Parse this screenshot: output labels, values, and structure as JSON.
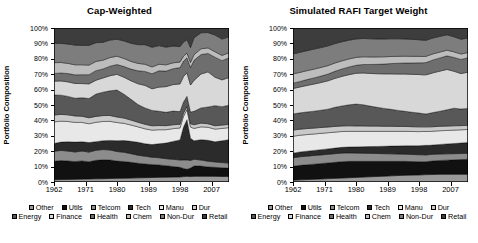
{
  "figure": {
    "ylabel": "Portfolio Composition",
    "y_ticks": [
      "0%",
      "10%",
      "20%",
      "30%",
      "40%",
      "50%",
      "60%",
      "70%",
      "80%",
      "90%",
      "100%"
    ],
    "x_ticks": [
      "1962",
      "1971",
      "1980",
      "1989",
      "1998",
      "2007"
    ]
  },
  "legend": {
    "rows": [
      [
        {
          "label": "Other",
          "color": "#9a9a9a"
        },
        {
          "label": "Utils",
          "color": "#111111"
        },
        {
          "label": "Telcom",
          "color": "#8c8c8c"
        },
        {
          "label": "Tech",
          "color": "#2b2b2b"
        },
        {
          "label": "Manu",
          "color": "#e8e8e8"
        },
        {
          "label": "Dur",
          "color": "#c9c9c9"
        }
      ],
      [
        {
          "label": "Energy",
          "color": "#585858"
        },
        {
          "label": "Finance",
          "color": "#d8d8d8"
        },
        {
          "label": "Health",
          "color": "#6e6e6e"
        },
        {
          "label": "Chem",
          "color": "#bdbdbd"
        },
        {
          "label": "Non-Dur",
          "color": "#7d7d7d"
        },
        {
          "label": "Retail",
          "color": "#3d3d3d"
        }
      ]
    ]
  },
  "chart_data": [
    {
      "type": "area",
      "title": "Cap-Weighted",
      "xlabel": "",
      "ylabel": "Portfolio Composition",
      "stacked": true,
      "normalized_percent": true,
      "ylim": [
        0,
        100
      ],
      "xlim": [
        1962,
        2012
      ],
      "grid": false,
      "legend_position": "bottom",
      "x": [
        1962,
        1964,
        1966,
        1968,
        1970,
        1972,
        1974,
        1976,
        1978,
        1980,
        1982,
        1984,
        1986,
        1988,
        1990,
        1992,
        1994,
        1996,
        1998,
        1999,
        2000,
        2001,
        2002,
        2004,
        2006,
        2008,
        2010,
        2012
      ],
      "series": [
        {
          "name": "Other",
          "color": "#9a9a9a",
          "values": [
            1.5,
            1.6,
            1.7,
            1.8,
            1.9,
            2.0,
            2.1,
            2.2,
            2.3,
            2.4,
            2.5,
            2.6,
            2.7,
            2.8,
            2.9,
            3.0,
            3.1,
            3.2,
            3.3,
            3.3,
            3.4,
            3.4,
            3.4,
            3.4,
            3.4,
            3.4,
            3.3,
            3.3
          ]
        },
        {
          "name": "Utils",
          "color": "#111111",
          "values": [
            12.0,
            12.3,
            12.0,
            11.5,
            11.8,
            11.2,
            12.0,
            12.5,
            12.0,
            11.2,
            10.8,
            10.2,
            9.5,
            8.8,
            8.4,
            8.0,
            7.4,
            6.8,
            6.2,
            5.0,
            4.2,
            5.4,
            6.2,
            6.0,
            5.6,
            5.4,
            5.2,
            5.0
          ]
        },
        {
          "name": "Telcom",
          "color": "#8c8c8c",
          "values": [
            6.5,
            6.6,
            6.4,
            6.2,
            6.4,
            6.2,
            6.5,
            6.8,
            6.5,
            6.2,
            6.0,
            5.6,
            5.2,
            5.0,
            4.8,
            4.6,
            4.5,
            4.6,
            4.8,
            5.2,
            5.6,
            4.8,
            4.0,
            3.6,
            3.4,
            3.2,
            3.1,
            3.0
          ]
        },
        {
          "name": "Tech",
          "color": "#2b2b2b",
          "values": [
            5.0,
            5.4,
            6.0,
            6.4,
            6.0,
            6.2,
            5.6,
            5.8,
            6.2,
            7.0,
            7.6,
            8.0,
            8.4,
            8.0,
            8.2,
            9.0,
            10.0,
            11.5,
            13.0,
            20.0,
            24.0,
            14.0,
            11.0,
            12.0,
            12.5,
            12.0,
            13.0,
            14.0
          ]
        },
        {
          "name": "Manu",
          "color": "#e8e8e8",
          "values": [
            14.0,
            13.6,
            13.2,
            12.8,
            12.6,
            12.2,
            12.6,
            12.8,
            12.4,
            11.8,
            11.2,
            10.6,
            10.0,
            9.6,
            9.4,
            9.0,
            8.6,
            8.2,
            7.8,
            6.6,
            6.0,
            7.0,
            7.4,
            7.6,
            7.8,
            7.6,
            7.4,
            7.2
          ]
        },
        {
          "name": "Dur",
          "color": "#c9c9c9",
          "values": [
            4.5,
            4.4,
            4.3,
            4.2,
            4.0,
            3.9,
            3.8,
            3.9,
            3.8,
            3.6,
            3.4,
            3.2,
            3.0,
            2.9,
            2.8,
            2.7,
            2.6,
            2.5,
            2.4,
            2.0,
            1.8,
            2.1,
            2.2,
            2.2,
            2.1,
            2.0,
            2.0,
            1.9
          ]
        },
        {
          "name": "Energy",
          "color": "#585858",
          "values": [
            13.0,
            12.5,
            12.0,
            11.5,
            12.0,
            12.5,
            14.5,
            15.5,
            16.0,
            17.5,
            15.5,
            13.5,
            11.5,
            10.5,
            10.0,
            9.2,
            8.6,
            8.8,
            8.2,
            6.8,
            6.2,
            7.4,
            8.0,
            9.0,
            10.0,
            12.0,
            11.0,
            11.5
          ]
        },
        {
          "name": "Finance",
          "color": "#d8d8d8",
          "values": [
            9.0,
            9.2,
            9.4,
            9.6,
            9.2,
            9.5,
            9.0,
            9.4,
            9.8,
            10.2,
            11.0,
            12.0,
            13.5,
            14.5,
            14.0,
            15.5,
            16.5,
            17.0,
            18.0,
            15.5,
            14.0,
            17.0,
            18.5,
            20.0,
            21.0,
            17.0,
            16.0,
            16.5
          ]
        },
        {
          "name": "Health",
          "color": "#6e6e6e",
          "values": [
            5.0,
            5.2,
            5.4,
            5.6,
            5.8,
            6.0,
            6.2,
            6.0,
            6.2,
            6.4,
            7.0,
            7.6,
            8.4,
            9.0,
            9.8,
            10.5,
            10.0,
            10.2,
            10.6,
            9.4,
            9.0,
            11.0,
            12.0,
            11.5,
            11.0,
            12.0,
            11.5,
            11.8
          ]
        },
        {
          "name": "Chem",
          "color": "#bdbdbd",
          "values": [
            7.0,
            6.8,
            6.6,
            6.5,
            6.4,
            6.2,
            6.0,
            5.8,
            5.6,
            5.4,
            5.2,
            5.0,
            4.8,
            4.6,
            4.4,
            4.2,
            4.0,
            3.8,
            3.6,
            3.0,
            2.8,
            3.2,
            3.4,
            3.4,
            3.3,
            3.2,
            3.1,
            3.0
          ]
        },
        {
          "name": "Non-Dur",
          "color": "#7d7d7d",
          "values": [
            12.5,
            12.4,
            12.6,
            12.8,
            12.6,
            12.8,
            12.2,
            11.8,
            11.4,
            11.0,
            11.4,
            11.8,
            12.2,
            12.6,
            12.8,
            12.0,
            11.4,
            10.8,
            10.0,
            8.6,
            8.0,
            9.4,
            10.0,
            9.5,
            9.2,
            10.0,
            9.8,
            9.5
          ]
        },
        {
          "name": "Retail",
          "color": "#3d3d3d",
          "values": [
            10.0,
            10.0,
            10.4,
            11.1,
            11.3,
            11.3,
            9.5,
            9.5,
            7.8,
            7.3,
            8.4,
            9.9,
            10.8,
            10.7,
            12.5,
            11.3,
            12.3,
            11.6,
            12.1,
            8.6,
            7.0,
            12.3,
            5.9,
            2.8,
            2.7,
            4.2,
            6.6,
            5.3
          ]
        }
      ]
    },
    {
      "type": "area",
      "title": "Simulated RAFI Target Weight",
      "xlabel": "",
      "ylabel": "Portfolio Composition",
      "stacked": true,
      "normalized_percent": true,
      "ylim": [
        0,
        100
      ],
      "xlim": [
        1962,
        2012
      ],
      "grid": false,
      "legend_position": "bottom",
      "x": [
        1962,
        1964,
        1966,
        1968,
        1970,
        1972,
        1974,
        1976,
        1978,
        1980,
        1982,
        1984,
        1986,
        1988,
        1990,
        1992,
        1994,
        1996,
        1998,
        1999,
        2000,
        2001,
        2002,
        2004,
        2006,
        2008,
        2010,
        2012
      ],
      "series": [
        {
          "name": "Other",
          "color": "#9a9a9a",
          "values": [
            1.2,
            1.4,
            1.6,
            1.8,
            2.0,
            2.2,
            2.4,
            2.6,
            2.8,
            3.0,
            3.2,
            3.4,
            3.6,
            3.8,
            4.0,
            4.2,
            4.4,
            4.5,
            4.6,
            4.7,
            4.8,
            4.8,
            4.9,
            5.0,
            5.0,
            5.0,
            5.0,
            5.0
          ]
        },
        {
          "name": "Utils",
          "color": "#111111",
          "values": [
            9.0,
            9.4,
            9.6,
            9.8,
            10.0,
            10.2,
            10.4,
            10.6,
            10.6,
            10.4,
            10.2,
            10.0,
            9.8,
            9.6,
            9.4,
            9.2,
            9.0,
            8.8,
            8.6,
            8.5,
            8.4,
            8.6,
            8.8,
            9.0,
            9.2,
            9.4,
            9.6,
            9.8
          ]
        },
        {
          "name": "Telcom",
          "color": "#8c8c8c",
          "values": [
            5.5,
            5.6,
            5.6,
            5.6,
            5.6,
            5.6,
            5.6,
            5.6,
            5.5,
            5.4,
            5.3,
            5.2,
            5.1,
            5.0,
            4.9,
            4.8,
            4.7,
            4.6,
            4.5,
            4.5,
            4.4,
            4.4,
            4.3,
            4.2,
            4.1,
            4.0,
            3.9,
            3.8
          ]
        },
        {
          "name": "Tech",
          "color": "#2b2b2b",
          "values": [
            3.0,
            3.1,
            3.2,
            3.3,
            3.4,
            3.5,
            3.6,
            3.7,
            3.8,
            4.0,
            4.2,
            4.4,
            4.6,
            4.8,
            5.0,
            5.2,
            5.4,
            5.6,
            5.8,
            6.0,
            6.2,
            6.0,
            6.0,
            6.2,
            6.4,
            6.6,
            6.8,
            7.0
          ]
        },
        {
          "name": "Manu",
          "color": "#e8e8e8",
          "values": [
            11.0,
            10.9,
            10.8,
            10.7,
            10.6,
            10.5,
            10.4,
            10.3,
            10.2,
            10.1,
            10.0,
            9.9,
            9.8,
            9.7,
            9.6,
            9.5,
            9.4,
            9.3,
            9.2,
            9.1,
            9.0,
            9.0,
            9.0,
            8.9,
            8.8,
            8.7,
            8.6,
            8.5
          ]
        },
        {
          "name": "Dur",
          "color": "#c9c9c9",
          "values": [
            4.0,
            3.9,
            3.9,
            3.8,
            3.8,
            3.7,
            3.7,
            3.6,
            3.6,
            3.5,
            3.5,
            3.4,
            3.4,
            3.3,
            3.3,
            3.2,
            3.2,
            3.1,
            3.1,
            3.0,
            3.0,
            3.0,
            2.9,
            2.9,
            2.8,
            2.8,
            2.7,
            2.7
          ]
        },
        {
          "name": "Energy",
          "color": "#585858",
          "values": [
            10.5,
            10.6,
            10.8,
            11.0,
            11.2,
            11.6,
            12.4,
            13.0,
            13.6,
            14.2,
            13.8,
            13.0,
            12.2,
            11.6,
            11.0,
            10.4,
            9.8,
            9.4,
            9.0,
            8.6,
            8.4,
            8.8,
            9.2,
            9.8,
            10.6,
            11.4,
            10.8,
            11.0
          ]
        },
        {
          "name": "Finance",
          "color": "#d8d8d8",
          "values": [
            16.5,
            16.8,
            17.2,
            17.6,
            18.0,
            18.4,
            18.8,
            19.2,
            19.6,
            20.0,
            20.6,
            21.2,
            21.8,
            22.4,
            23.0,
            23.6,
            24.2,
            24.6,
            25.0,
            25.2,
            25.4,
            25.6,
            25.8,
            26.0,
            26.2,
            24.0,
            23.0,
            23.5
          ]
        },
        {
          "name": "Health",
          "color": "#6e6e6e",
          "values": [
            3.5,
            3.6,
            3.8,
            4.0,
            4.2,
            4.4,
            4.6,
            4.8,
            5.0,
            5.2,
            5.5,
            5.8,
            6.1,
            6.4,
            6.7,
            7.0,
            7.2,
            7.4,
            7.6,
            7.8,
            8.0,
            8.2,
            8.4,
            8.6,
            8.8,
            9.0,
            9.2,
            9.4
          ]
        },
        {
          "name": "Chem",
          "color": "#bdbdbd",
          "values": [
            6.0,
            5.9,
            5.8,
            5.7,
            5.6,
            5.5,
            5.4,
            5.3,
            5.2,
            5.1,
            5.0,
            4.9,
            4.8,
            4.7,
            4.6,
            4.5,
            4.4,
            4.3,
            4.2,
            4.1,
            4.0,
            4.0,
            3.9,
            3.8,
            3.7,
            3.6,
            3.5,
            3.4
          ]
        },
        {
          "name": "Non-Dur",
          "color": "#7d7d7d",
          "values": [
            13.0,
            13.0,
            13.0,
            13.0,
            12.9,
            12.8,
            12.6,
            12.4,
            12.2,
            12.0,
            11.9,
            11.8,
            11.7,
            11.6,
            11.5,
            11.4,
            11.2,
            11.0,
            10.8,
            10.6,
            10.4,
            10.4,
            10.3,
            10.2,
            10.0,
            9.8,
            9.6,
            9.4
          ]
        },
        {
          "name": "Retail",
          "color": "#3d3d3d",
          "values": [
            16.8,
            15.8,
            14.7,
            13.7,
            12.7,
            11.6,
            10.1,
            8.9,
            7.9,
            7.1,
            6.8,
            7.0,
            7.1,
            7.1,
            7.0,
            7.0,
            7.1,
            7.4,
            7.6,
            7.9,
            8.0,
            7.2,
            6.5,
            5.4,
            4.4,
            5.7,
            7.3,
            6.5
          ]
        }
      ]
    }
  ]
}
